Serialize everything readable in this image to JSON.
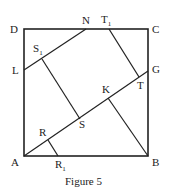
{
  "figure": {
    "caption": "Figure 5",
    "points": {
      "A": {
        "label": "A",
        "x": 24,
        "y": 156
      },
      "B": {
        "label": "B",
        "x": 148,
        "y": 156
      },
      "C": {
        "label": "C",
        "x": 148,
        "y": 29
      },
      "D": {
        "label": "D",
        "x": 24,
        "y": 29
      },
      "N": {
        "label": "N",
        "x": 86,
        "y": 29
      },
      "T1": {
        "label": "T",
        "sub": "1",
        "x": 109,
        "y": 29
      },
      "G": {
        "label": "G",
        "x": 148,
        "y": 71
      },
      "L": {
        "label": "L",
        "x": 24,
        "y": 70
      },
      "S1": {
        "label": "S",
        "sub": "1",
        "x": 42,
        "y": 59
      },
      "K": {
        "label": "K",
        "x": 108,
        "y": 92
      },
      "T": {
        "label": "T",
        "x": 139,
        "y": 77
      },
      "S": {
        "label": "S",
        "x": 80,
        "y": 119
      },
      "R": {
        "label": "R",
        "x": 48,
        "y": 140
      },
      "R1": {
        "label": "R",
        "sub": "1",
        "x": 58,
        "y": 156
      }
    },
    "segments": [
      "D-C",
      "C-B",
      "B-A",
      "A-D",
      "A-G",
      "L-N",
      "S1-S",
      "T1-T",
      "K-B",
      "R-R1"
    ],
    "stroke_color": "#222222"
  }
}
